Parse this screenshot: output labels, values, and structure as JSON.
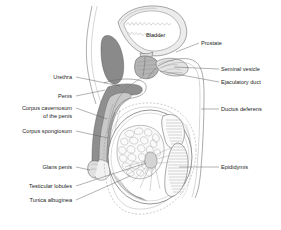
{
  "figure": {
    "background_color": "#ffffff",
    "text_color": "#1c1c1c",
    "leader_color": "#555555",
    "outline_color": "#6d6d6d"
  },
  "palette": {
    "dark_gray": "#8a8a8a",
    "mid_gray": "#b4b4b4",
    "light_gray": "#dcdcdc",
    "pale_gray": "#ececec",
    "very_pale": "#f6f6f6",
    "white": "#ffffff"
  },
  "labels_left": [
    {
      "id": "urethra",
      "text": "Urethra",
      "lines": [
        "Urethra"
      ],
      "x": 74,
      "y": 79
    },
    {
      "id": "penis",
      "text": "Penis",
      "lines": [
        "Penis"
      ],
      "x": 74,
      "y": 98
    },
    {
      "id": "corpus-cavernosum",
      "text": "Corpus cavernosum of the penis",
      "lines": [
        "Corpus cavernosum",
        "of the penis"
      ],
      "x": 74,
      "y": 110
    },
    {
      "id": "corpus-spongiosum",
      "text": "Corpus spongiosum",
      "lines": [
        "Corpus spongiosum"
      ],
      "x": 74,
      "y": 133
    },
    {
      "id": "glans-penis",
      "text": "Glans penis",
      "lines": [
        "Glans penis"
      ],
      "x": 74,
      "y": 169
    },
    {
      "id": "testicular-lobules",
      "text": "Testicular lobules",
      "lines": [
        "Testicular lobules"
      ],
      "x": 74,
      "y": 188
    },
    {
      "id": "tunica-albuginea",
      "text": "Tunica albuginea",
      "lines": [
        "Tunica albuginea"
      ],
      "x": 74,
      "y": 202
    }
  ],
  "labels_right": [
    {
      "id": "prostate",
      "text": "Prostate",
      "lines": [
        "Prostate"
      ],
      "x": 201,
      "y": 45
    },
    {
      "id": "seminal-vesicle",
      "text": "Seminal vesicle",
      "lines": [
        "Seminal vesicle"
      ],
      "x": 221,
      "y": 71
    },
    {
      "id": "ejaculatory-duct",
      "text": "Ejaculatory duct",
      "lines": [
        "Ejaculatory duct"
      ],
      "x": 221,
      "y": 84
    },
    {
      "id": "ductus-deferens",
      "text": "Ductus deferens",
      "lines": [
        "Ductus deferens"
      ],
      "x": 221,
      "y": 111
    },
    {
      "id": "epididymis",
      "text": "Epididymis",
      "lines": [
        "Epididymis"
      ],
      "x": 221,
      "y": 169
    }
  ],
  "labels_inner": [
    {
      "id": "bladder",
      "text": "Bladder",
      "x": 151,
      "y": 37
    }
  ]
}
